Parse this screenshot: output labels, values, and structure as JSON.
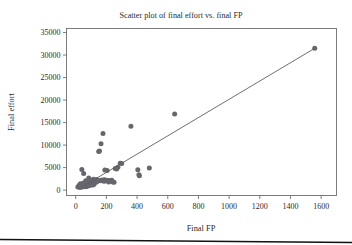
{
  "figure": {
    "background_color": "#ffffff",
    "point_color": "#66666d",
    "line_color": "#5d5d63",
    "axis_color": "#6f6f6f",
    "bottom_rule_color": "#111111"
  },
  "chart_data": {
    "type": "scatter",
    "title": "Scatter plot of final effort vs. final FP",
    "xlabel": "Final FP",
    "ylabel": "Final effort",
    "xlim": [
      -60,
      1700
    ],
    "ylim": [
      -1200,
      35900
    ],
    "xticks": [
      0,
      200,
      400,
      600,
      800,
      1000,
      1200,
      1400,
      1600
    ],
    "yticks": [
      0,
      5000,
      10000,
      15000,
      20000,
      25000,
      30000,
      35000
    ],
    "xtick_labels": [
      "0",
      "200",
      "400",
      "600",
      "800",
      "1000",
      "1200",
      "1400",
      "1600"
    ],
    "ytick_labels": [
      "0",
      "5000",
      "10000",
      "15000",
      "20000",
      "25000",
      "30000",
      "35000"
    ],
    "grid": false,
    "legend": null,
    "series": [
      {
        "name": "Projects",
        "marker": "circle",
        "x": [
          14,
          20,
          24,
          28,
          30,
          33,
          36,
          38,
          40,
          42,
          45,
          47,
          50,
          52,
          55,
          57,
          58,
          60,
          62,
          63,
          65,
          66,
          68,
          70,
          72,
          74,
          75,
          77,
          78,
          80,
          82,
          84,
          85,
          88,
          90,
          92,
          95,
          97,
          100,
          103,
          105,
          108,
          110,
          112,
          115,
          118,
          120,
          124,
          128,
          132,
          136,
          140,
          145,
          150,
          155,
          160,
          165,
          170,
          175,
          178,
          182,
          185,
          188,
          190,
          192,
          196,
          200,
          205,
          210,
          215,
          222,
          228,
          235,
          242,
          250,
          258,
          266,
          275,
          290,
          300,
          360,
          405,
          412,
          415,
          480,
          645,
          1558
        ],
        "y": [
          700,
          900,
          1100,
          600,
          1400,
          800,
          1000,
          1250,
          4550,
          700,
          900,
          1500,
          1150,
          3700,
          800,
          1000,
          1300,
          1600,
          900,
          1100,
          2100,
          750,
          1250,
          1450,
          1000,
          1700,
          850,
          1300,
          1100,
          2000,
          950,
          1500,
          2700,
          1200,
          1600,
          1000,
          2200,
          1400,
          1800,
          1250,
          2100,
          1550,
          1900,
          1150,
          2400,
          1700,
          1300,
          2000,
          2150,
          1750,
          2350,
          1900,
          2200,
          8600,
          8700,
          2050,
          10300,
          2250,
          2100,
          12600,
          2200,
          1950,
          2300,
          4450,
          2150,
          2100,
          2200,
          4350,
          2150,
          1800,
          2100,
          2150,
          2200,
          1800,
          1750,
          4800,
          4700,
          5100,
          5950,
          5900,
          14200,
          4500,
          3400,
          3200,
          4900,
          16900,
          31500
        ]
      }
    ],
    "trendline": {
      "name": "Fitted regression line",
      "x": [
        58,
        1558
      ],
      "y": [
        1050,
        31500
      ]
    }
  }
}
